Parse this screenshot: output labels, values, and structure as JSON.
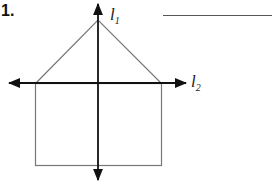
{
  "question": {
    "number": "1.",
    "answer_blank": ""
  },
  "figure": {
    "lines": [
      {
        "name": "l",
        "subscript": "1",
        "orientation": "vertical"
      },
      {
        "name": "l",
        "subscript": "2",
        "orientation": "horizontal"
      }
    ],
    "colors": {
      "shape_stroke": "#777777",
      "axis_stroke": "#111111"
    }
  }
}
